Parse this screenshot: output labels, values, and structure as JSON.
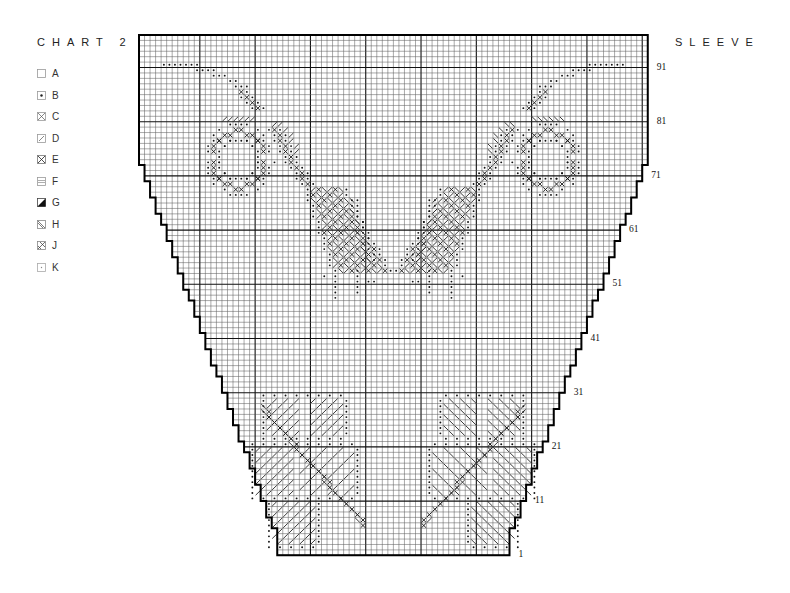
{
  "header": {
    "chart_title": "CHART 2",
    "section_title": "SLEEVE"
  },
  "legend": [
    {
      "key": "A",
      "symbol": "blank"
    },
    {
      "key": "B",
      "symbol": "dot"
    },
    {
      "key": "C",
      "symbol": "cross-dot"
    },
    {
      "key": "D",
      "symbol": "slash-dot"
    },
    {
      "key": "E",
      "symbol": "cross"
    },
    {
      "key": "F",
      "symbol": "horizontal-lines"
    },
    {
      "key": "G",
      "symbol": "solid-triangle"
    },
    {
      "key": "H",
      "symbol": "backslash"
    },
    {
      "key": "J",
      "symbol": "slash-cross"
    },
    {
      "key": "K",
      "symbol": "small-dot"
    }
  ],
  "grid": {
    "origin_x": 139,
    "origin_y": 35,
    "cell_w": 5.53,
    "cell_h": 5.42,
    "cols": 92,
    "rows": 96,
    "major_every": 10,
    "line_color": "#555555",
    "major_color": "#111111",
    "border_color": "#000000"
  },
  "row_labels": [
    "1",
    "11",
    "21",
    "31",
    "41",
    "51",
    "61",
    "71",
    "81",
    "91"
  ],
  "chart_data": {
    "type": "table",
    "top_width_stitches": 92,
    "bottom_width_stitches": 42,
    "total_rows": 96,
    "row_label_values": [
      1,
      11,
      21,
      31,
      41,
      51,
      61,
      71,
      81,
      91
    ],
    "legend_keys": [
      "A",
      "B",
      "C",
      "D",
      "E",
      "F",
      "G",
      "H",
      "J",
      "K"
    ],
    "motifs": [
      {
        "name": "upper-left ring and leaf spray",
        "rows_from_top": [
          5,
          48
        ],
        "cols": [
          4,
          42
        ]
      },
      {
        "name": "upper-right ring and leaf spray (mirror)",
        "rows_from_top": [
          5,
          48
        ],
        "cols": [
          49,
          87
        ]
      },
      {
        "name": "lower-left flower cluster",
        "rows_from_top": [
          66,
          94
        ],
        "cols": [
          23,
          44
        ]
      },
      {
        "name": "lower-right flower cluster",
        "rows_from_top": [
          66,
          94
        ],
        "cols": [
          48,
          69
        ]
      }
    ]
  },
  "shape": {
    "straight_top_rows": 22,
    "straight_bottom_rows": 4,
    "decrease_per_side": 25
  }
}
